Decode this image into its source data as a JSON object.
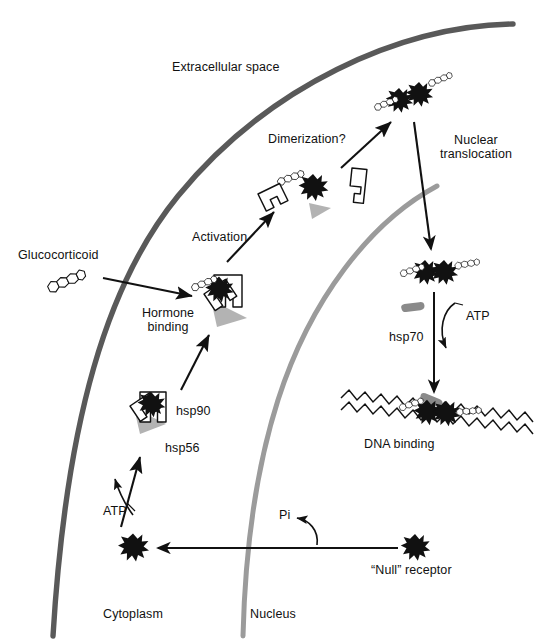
{
  "diagram": {
    "compartments": {
      "extracellular": "Extracellular space",
      "cytoplasm": "Cytoplasm",
      "nucleus": "Nucleus"
    },
    "colors": {
      "cell_membrane": "#595959",
      "nuclear_membrane": "#9b9b9b",
      "receptor": "#111111",
      "hsp56_shadow": "#b3b3b3",
      "hsp70": "#8a8a8a",
      "text": "#111111",
      "background": "#ffffff",
      "dna": "#111111"
    },
    "labels": [
      {
        "id": "extracellular-space",
        "text": "Extracellular space",
        "x": 172,
        "y": 60,
        "size": 13
      },
      {
        "id": "glucocorticoid",
        "text": "Glucocorticoid",
        "x": 18,
        "y": 248,
        "size": 13
      },
      {
        "id": "hormone-binding",
        "text": "Hormone\nbinding",
        "x": 137,
        "y": 305,
        "size": 13
      },
      {
        "id": "activation",
        "text": "Activation",
        "x": 192,
        "y": 229,
        "size": 13
      },
      {
        "id": "dimerization",
        "text": "Dimerization?",
        "x": 268,
        "y": 132,
        "size": 13
      },
      {
        "id": "nuclear-translocation",
        "text": "Nuclear\ntranslocation",
        "x": 434,
        "y": 133,
        "size": 13
      },
      {
        "id": "hsp90",
        "text": "hsp90",
        "x": 176,
        "y": 404,
        "size": 13
      },
      {
        "id": "hsp56",
        "text": "hsp56",
        "x": 165,
        "y": 441,
        "size": 13
      },
      {
        "id": "atp-cytoplasm",
        "text": "ATP",
        "x": 103,
        "y": 503,
        "size": 13
      },
      {
        "id": "atp-nucleus",
        "text": "ATP",
        "x": 465,
        "y": 308,
        "size": 13
      },
      {
        "id": "hsp70",
        "text": "hsp70",
        "x": 389,
        "y": 330,
        "size": 13
      },
      {
        "id": "dna-binding",
        "text": "DNA binding",
        "x": 364,
        "y": 436,
        "size": 13
      },
      {
        "id": "pi",
        "text": "Pi",
        "x": 279,
        "y": 508,
        "size": 13
      },
      {
        "id": "null-receptor",
        "text": "“Null” receptor",
        "x": 371,
        "y": 563,
        "size": 13
      },
      {
        "id": "cytoplasm",
        "text": "Cytoplasm",
        "x": 103,
        "y": 607,
        "size": 13
      },
      {
        "id": "nucleus",
        "text": "Nucleus",
        "x": 250,
        "y": 607,
        "size": 13
      }
    ],
    "steps": [
      "Glucocorticoid enters cell and binds receptor (hormone binding)",
      "Receptor complexed with hsp90 and hsp56 in cytoplasm; ATP required",
      "Activation releases hsp90 and hsp56",
      "Dimerization? of hormone-bound receptors",
      "Nuclear translocation into nucleus",
      "hsp70 and ATP assist; DNA binding of receptor dimer",
      "“Null” receptor returns to cytoplasm releasing Pi"
    ],
    "entities": [
      {
        "name": "glucocorticoid-steroid",
        "shape": "four-fused-hexagon-rings",
        "fill": "white",
        "stroke": "#111111"
      },
      {
        "name": "receptor",
        "shape": "black-star",
        "fill": "#111111"
      },
      {
        "name": "hsp90",
        "shape": "white-polygon-outline",
        "fill": "white",
        "stroke": "#111111"
      },
      {
        "name": "hsp56",
        "shape": "gray-triangle",
        "fill": "#b3b3b3"
      },
      {
        "name": "hsp70",
        "shape": "gray-rod",
        "fill": "#8a8a8a"
      },
      {
        "name": "dna",
        "shape": "zigzag-double-helix",
        "stroke": "#111111"
      }
    ]
  }
}
